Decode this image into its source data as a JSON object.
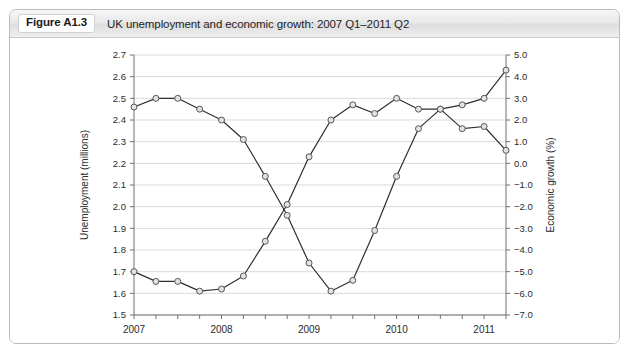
{
  "figure": {
    "badge": "Figure A1.3",
    "title": "UK unemployment and economic growth: 2007 Q1–2011 Q2"
  },
  "chart_data": {
    "type": "line",
    "title": "UK unemployment and economic growth: 2007 Q1–2011 Q2",
    "xlabel": "",
    "grid": true,
    "legend_position": "none",
    "x": [
      "2007 Q1",
      "2007 Q2",
      "2007 Q3",
      "2007 Q4",
      "2008 Q1",
      "2008 Q2",
      "2008 Q3",
      "2008 Q4",
      "2009 Q1",
      "2009 Q2",
      "2009 Q3",
      "2009 Q4",
      "2010 Q1",
      "2010 Q2",
      "2010 Q3",
      "2010 Q4",
      "2011 Q1",
      "2011 Q2"
    ],
    "x_tick_labels": [
      "2007",
      "2008",
      "2009",
      "2010",
      "2011"
    ],
    "x_tick_positions": [
      0,
      4,
      8,
      12,
      16
    ],
    "axes": [
      {
        "side": "left",
        "label": "Unemployment (millions)",
        "lim": [
          1.5,
          2.7
        ],
        "ticks": [
          "2.7",
          "2.6",
          "2.5",
          "2.4",
          "2.3",
          "2.2",
          "2.1",
          "2.0",
          "1.9",
          "1.8",
          "1.7",
          "1.6",
          "1.5"
        ],
        "tick_values": [
          2.7,
          2.6,
          2.5,
          2.4,
          2.3,
          2.2,
          2.1,
          2.0,
          1.9,
          1.8,
          1.7,
          1.6,
          1.5
        ]
      },
      {
        "side": "right",
        "label": "Economic growth (%)",
        "lim": [
          -7.0,
          5.0
        ],
        "ticks": [
          "5.0",
          "4.0",
          "3.0",
          "2.0",
          "1.0",
          "0.0",
          "−1.0",
          "−2.0",
          "−3.0",
          "−4.0",
          "−5.0",
          "−6.0",
          "−7.0"
        ],
        "tick_values": [
          5.0,
          4.0,
          3.0,
          2.0,
          1.0,
          0.0,
          -1.0,
          -2.0,
          -3.0,
          -4.0,
          -5.0,
          -6.0,
          -7.0
        ]
      }
    ],
    "series": [
      {
        "name": "Unemployment (millions)",
        "axis": "left",
        "marker": "circle",
        "values": [
          1.7,
          1.655,
          1.655,
          1.61,
          1.62,
          1.68,
          1.84,
          2.01,
          2.23,
          2.4,
          2.47,
          2.43,
          2.5,
          2.45,
          2.45,
          2.47,
          2.5,
          2.63
        ]
      },
      {
        "name": "Economic growth (%)",
        "axis": "right",
        "marker": "circle",
        "values": [
          2.6,
          3.0,
          3.0,
          2.5,
          2.0,
          1.1,
          -0.6,
          -2.4,
          -4.6,
          -5.9,
          -5.4,
          -3.1,
          -0.6,
          1.6,
          2.5,
          1.6,
          1.7,
          0.6
        ]
      }
    ]
  }
}
